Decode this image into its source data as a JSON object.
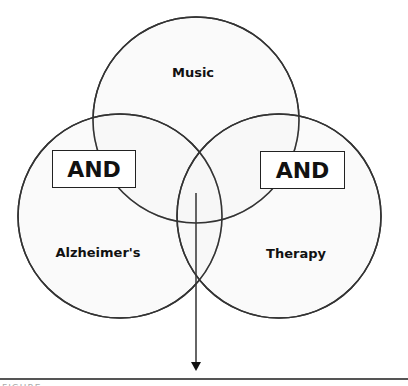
{
  "diagram": {
    "type": "venn-search-logic",
    "colors": {
      "circle_fill": "#f7f7f7",
      "circle_stroke": "#333333",
      "arrow": "#333333",
      "operator_box_fill": "#ffffff",
      "operator_box_stroke": "#222222"
    },
    "circles": [
      {
        "label": "Music",
        "cx": 196,
        "cy": 120,
        "r": 103
      },
      {
        "label": "Alzheimer's",
        "cx": 120,
        "cy": 216,
        "r": 102
      },
      {
        "label": "Therapy",
        "cx": 279,
        "cy": 216,
        "r": 102
      }
    ],
    "operators": [
      {
        "label": "AND",
        "position": "left"
      },
      {
        "label": "AND",
        "position": "right"
      }
    ],
    "arrow": {
      "direction": "down",
      "from_region": "intersection of Music, Alzheimer's, Therapy"
    }
  },
  "caption": {
    "text": "FIGURE"
  }
}
